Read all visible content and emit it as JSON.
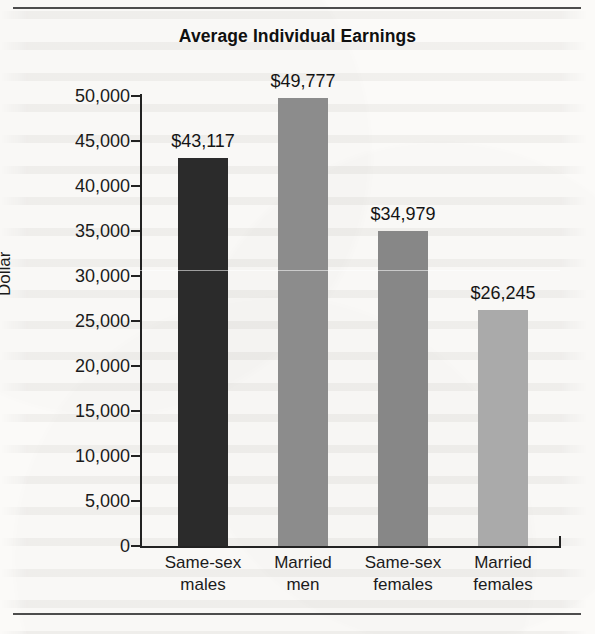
{
  "figure": {
    "title": "Average Individual Earnings",
    "y_axis_title": "Dollar"
  },
  "chart_data": {
    "type": "bar",
    "title": "Average Individual Earnings",
    "xlabel": "",
    "ylabel": "Dollar",
    "ylim": [
      0,
      50000
    ],
    "ytick_labels": [
      "50,000",
      "45,000",
      "40,000",
      "35,000",
      "30,000",
      "25,000",
      "20,000",
      "15,000",
      "10,000",
      "5,000",
      "0"
    ],
    "ytick_values": [
      50000,
      45000,
      40000,
      35000,
      30000,
      25000,
      20000,
      15000,
      10000,
      5000,
      0
    ],
    "grid": false,
    "legend": "none",
    "categories": [
      [
        "Same-sex",
        "males"
      ],
      [
        "Married",
        "men"
      ],
      [
        "Same-sex",
        "females"
      ],
      [
        "Married",
        "females"
      ]
    ],
    "values": [
      43117,
      49777,
      34979,
      26245
    ],
    "value_labels": [
      "$43,117",
      "$49,777",
      "$34,979",
      "$26,245"
    ],
    "bar_colors": [
      "#2b2b2b",
      "#8c8c8c",
      "#878787",
      "#aaaaaa"
    ]
  }
}
